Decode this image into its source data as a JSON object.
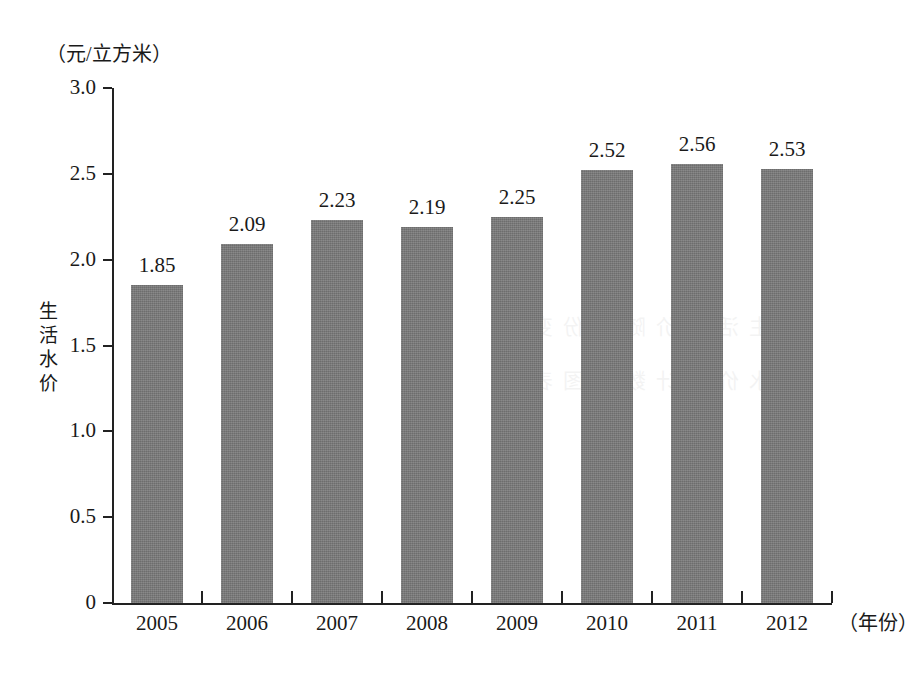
{
  "chart_data": {
    "type": "bar",
    "title": "",
    "subtitle": "",
    "unit_caption": "（元/立方米）",
    "ylabel": "生活水价",
    "xlabel": "（年份）",
    "categories": [
      "2005",
      "2006",
      "2007",
      "2008",
      "2009",
      "2010",
      "2011",
      "2012"
    ],
    "values": [
      1.85,
      2.09,
      2.23,
      2.19,
      2.25,
      2.52,
      2.56,
      2.53
    ],
    "value_labels": [
      "1.85",
      "2.09",
      "2.23",
      "2.19",
      "2.25",
      "2.52",
      "2.56",
      "2.53"
    ],
    "ylim": [
      0,
      3.0
    ],
    "ytick_values": [
      0,
      0.5,
      1.0,
      1.5,
      2.0,
      2.5,
      3.0
    ],
    "ytick_labels": [
      "0",
      "0.5",
      "1.0",
      "1.5",
      "2.0",
      "2.5",
      "3.0"
    ],
    "grid": false,
    "legend": null,
    "legend_position": "none",
    "series": [
      {
        "name": "生活水价",
        "values": [
          1.85,
          2.09,
          2.23,
          2.19,
          2.25,
          2.52,
          2.56,
          2.53
        ],
        "color": "#787878"
      }
    ],
    "annotations": []
  },
  "colors": {
    "bar": "#787878",
    "axis": "#222222",
    "text": "#1a1a1a",
    "background": "#ffffff"
  },
  "watermark": {
    "text": "生活水价随年份变化\n水价统计数据图表"
  }
}
